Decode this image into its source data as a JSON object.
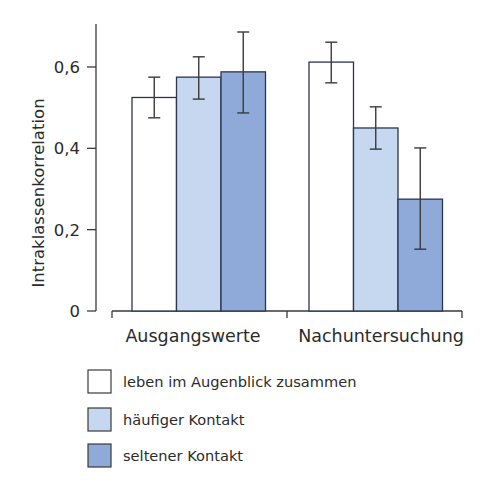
{
  "chart_data": {
    "type": "bar",
    "title": "",
    "xlabel": "",
    "ylabel": "Intraklassenkorrelation",
    "ylim": [
      0,
      0.7
    ],
    "yticks": [
      0,
      0.2,
      0.4,
      0.6
    ],
    "ytick_labels": [
      "0",
      "0,2",
      "0,4",
      "0,6"
    ],
    "grid": false,
    "legend_position": "bottom",
    "categories": [
      "Ausgangswerte",
      "Nachuntersuchung"
    ],
    "series": [
      {
        "name": "leben im Augenblick zusammen",
        "color": "#ffffff",
        "values": [
          0.525,
          0.612
        ],
        "error_low": [
          0.475,
          0.561
        ],
        "error_high": [
          0.575,
          0.661
        ]
      },
      {
        "name": "häufiger Kontakt",
        "color": "#c5d8f0",
        "values": [
          0.575,
          0.45
        ],
        "error_low": [
          0.521,
          0.398
        ],
        "error_high": [
          0.625,
          0.502
        ]
      },
      {
        "name": "seltener Kontakt",
        "color": "#8fa9d8",
        "values": [
          0.588,
          0.275
        ],
        "error_low": [
          0.487,
          0.152
        ],
        "error_high": [
          0.686,
          0.401
        ]
      }
    ]
  },
  "colors": {
    "axis": "#3a3a3a",
    "bar_border": "#2a3550",
    "text": "#2b2b2b"
  }
}
